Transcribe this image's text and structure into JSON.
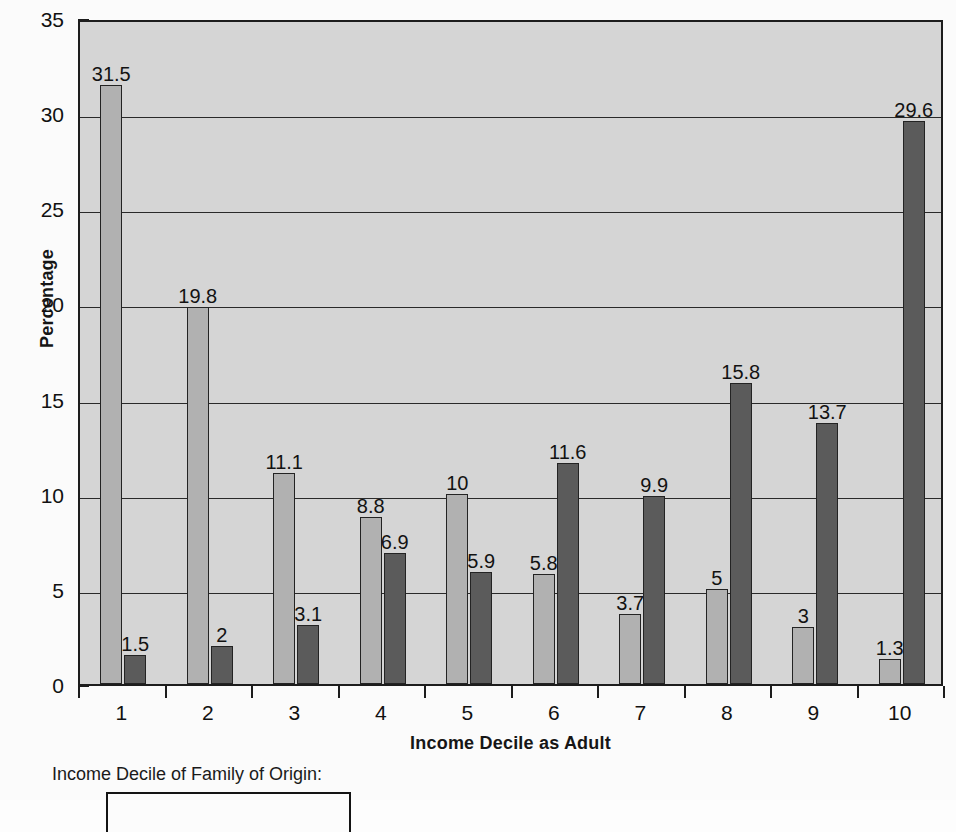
{
  "chart_data": {
    "type": "bar",
    "title": "",
    "xlabel": "Income Decile as Adult",
    "ylabel": "Percentage",
    "categories": [
      "1",
      "2",
      "3",
      "4",
      "5",
      "6",
      "7",
      "8",
      "9",
      "10"
    ],
    "series": [
      {
        "name": "Lowest Income Decile of Family of Origin",
        "color": "#b1b1b1",
        "values": [
          31.5,
          19.8,
          11.1,
          8.8,
          10,
          5.8,
          3.7,
          5,
          3,
          1.3
        ],
        "labels": [
          "31.5",
          "19.8",
          "11.1",
          "8.8",
          "10",
          "5.8",
          "3.7",
          "5",
          "3",
          "1.3"
        ]
      },
      {
        "name": "Highest Income Decile of Family of Origin",
        "color": "#5b5b5b",
        "values": [
          1.5,
          2,
          3.1,
          6.9,
          5.9,
          11.6,
          9.9,
          15.8,
          13.7,
          29.6
        ],
        "labels": [
          "1.5",
          "2",
          "3.1",
          "6.9",
          "5.9",
          "11.6",
          "9.9",
          "15.8",
          "13.7",
          "29.6"
        ]
      }
    ],
    "ylim": [
      0,
      35
    ],
    "yticks": [
      0,
      5,
      10,
      15,
      20,
      25,
      30,
      35
    ],
    "ytick_labels": [
      "0",
      "5",
      "10",
      "15",
      "20",
      "25",
      "30",
      "35"
    ],
    "grid": "horizontal",
    "legend_position": "below-plot",
    "plot_background": "#d5d5d5",
    "axis_color": "#1d1d1d"
  },
  "legend": {
    "title": "Income Decile of Family of Origin:",
    "box_truncated": true
  }
}
